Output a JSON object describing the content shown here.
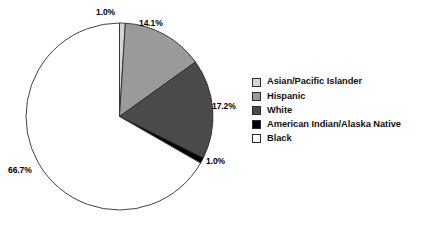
{
  "chart_data": {
    "type": "pie",
    "title": "",
    "subtitle": "",
    "xlabel": "",
    "ylabel": "",
    "grid": false,
    "legend_position": "right",
    "units": "percent",
    "start_angle_deg": 0,
    "direction": "clockwise",
    "categories": [
      "Asian/Pacific Islander",
      "Hispanic",
      "White",
      "American Indian/Alaska Native",
      "Black"
    ],
    "values": [
      1.0,
      14.1,
      17.2,
      1.0,
      66.7
    ],
    "value_labels": [
      "1.0%",
      "14.1%",
      "17.2%",
      "1.0%",
      "66.7%"
    ],
    "slice_colors": [
      "#d5d5d5",
      "#9a9a9a",
      "#4a4a4a",
      "#000000",
      "#ffffff"
    ],
    "slices": [
      {
        "label": "Asian/Pacific Islander",
        "value": 1.0,
        "value_label": "1.0%",
        "color": "#d5d5d5"
      },
      {
        "label": "Hispanic",
        "value": 14.1,
        "value_label": "14.1%",
        "color": "#9a9a9a"
      },
      {
        "label": "White",
        "value": 17.2,
        "value_label": "17.2%",
        "color": "#4a4a4a"
      },
      {
        "label": "American Indian/Alaska Native",
        "value": 1.0,
        "value_label": "1.0%",
        "color": "#000000"
      },
      {
        "label": "Black",
        "value": 66.7,
        "value_label": "66.7%",
        "color": "#ffffff"
      }
    ]
  },
  "pie": {
    "labels": {
      "asian_pacific_islander": "1.0%",
      "hispanic": "14.1%",
      "white": "17.2%",
      "american_indian_alaska_native": "1.0%",
      "black": "66.7%"
    }
  },
  "legend": {
    "items": [
      {
        "label": "Asian/Pacific Islander",
        "color": "#d5d5d5"
      },
      {
        "label": "Hispanic",
        "color": "#9a9a9a"
      },
      {
        "label": "White",
        "color": "#4a4a4a"
      },
      {
        "label": "American Indian/Alaska Native",
        "color": "#000000"
      },
      {
        "label": "Black",
        "color": "#ffffff"
      }
    ]
  },
  "colors": {
    "outline": "#2b2b2b",
    "text": "#111111",
    "background": "#ffffff"
  }
}
